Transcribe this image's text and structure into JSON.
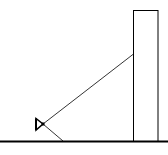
{
  "diagram": {
    "colors": {
      "stroke": "#000000",
      "background": "#ffffff"
    },
    "ground": {
      "x1": 0,
      "y1": 141.5,
      "x2": 168,
      "y2": 141.5
    },
    "building": {
      "x": 133.5,
      "y": 10.5,
      "width": 24.5,
      "height": 131
    },
    "instrument": {
      "x": 43,
      "y": 124
    },
    "sight_line": {
      "x1": 43,
      "y1": 124,
      "x2": 133.5,
      "y2": 54
    },
    "support_leg": {
      "x1": 43,
      "y1": 124,
      "x2": 63,
      "y2": 141
    },
    "labels": []
  }
}
